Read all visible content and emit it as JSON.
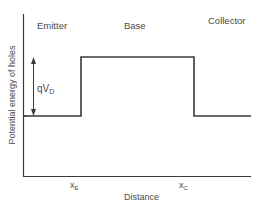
{
  "diagram": {
    "title": "",
    "y_axis_label": "Potential energy of holes",
    "x_axis_label": "Distance",
    "regions": [
      {
        "name": "emitter",
        "label": "Emitter"
      },
      {
        "name": "base",
        "label": "Base"
      },
      {
        "name": "collector",
        "label": "Collector"
      }
    ],
    "ticks": [
      {
        "name": "x-e",
        "main": "x",
        "sub": "E"
      },
      {
        "name": "x-c",
        "main": "x",
        "sub": "C"
      }
    ],
    "barrier_label": {
      "main": "qV",
      "sub": "D"
    },
    "colors": {
      "line": "#3a3a3a",
      "text": "#4a4a4a",
      "background": "#ffffff"
    },
    "profile": {
      "levels": [
        "low",
        "high",
        "low"
      ],
      "description": "Step profile: low in emitter, raised by qV_D in base, low in collector"
    }
  }
}
